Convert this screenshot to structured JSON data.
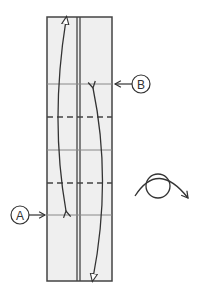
{
  "diagram": {
    "type": "origami-fold-step",
    "labels": {
      "a": "A",
      "b": "B"
    },
    "colors": {
      "paper": "#efefef",
      "stroke": "#444444",
      "crease": "#888888",
      "background": "#ffffff"
    },
    "strip": {
      "x": 47,
      "y": 17,
      "width": 65,
      "height": 264,
      "center_double_line_x": [
        77,
        80
      ]
    },
    "creases": [
      {
        "y": 84,
        "style": "thin"
      },
      {
        "y": 117,
        "style": "dashed"
      },
      {
        "y": 150,
        "style": "thin"
      },
      {
        "y": 183,
        "style": "dashed"
      },
      {
        "y": 215,
        "style": "thin"
      }
    ],
    "markers": [
      {
        "label": "B",
        "y": 84,
        "side": "right"
      },
      {
        "label": "A",
        "y": 215,
        "side": "left"
      }
    ],
    "symbols": [
      "turn-over-icon"
    ]
  }
}
